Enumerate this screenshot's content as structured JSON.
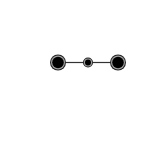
{
  "diagram": {
    "type": "node-link",
    "background": "#ffffff",
    "edge_color": "#333333",
    "node_fill": "#000000",
    "node_ring": "#a0a0a0",
    "node_border": "#222222",
    "nodes": [
      {
        "id": "left",
        "cx": 58,
        "cy": 62.5,
        "r": 8
      },
      {
        "id": "middle",
        "cx": 88,
        "cy": 62.5,
        "r": 5
      },
      {
        "id": "right",
        "cx": 118,
        "cy": 62.5,
        "r": 8
      }
    ],
    "edges": [
      {
        "from": "left",
        "to": "middle"
      },
      {
        "from": "middle",
        "to": "right"
      }
    ]
  }
}
